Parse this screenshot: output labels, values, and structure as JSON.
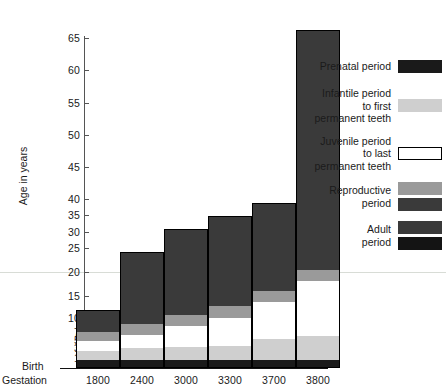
{
  "chart_data": {
    "type": "bar",
    "title": "",
    "xlabel": "Gestation",
    "ylabel": "Age in years",
    "grid": false,
    "legend_position": "right",
    "axis_note": "non-linear compressed y-axis at low values",
    "ylim": [
      0,
      67
    ],
    "ytick_labels": [
      "1",
      "3",
      "5",
      "7",
      "10",
      "15",
      "20",
      "25",
      "30",
      "35",
      "40",
      "45",
      "50",
      "55",
      "60",
      "65"
    ],
    "ytick_pixels": [
      358,
      348,
      340,
      332,
      318,
      296,
      272,
      248,
      232,
      215,
      199,
      167,
      135,
      103,
      70,
      38
    ],
    "categories": [
      "1800",
      "2400",
      "3000",
      "3300",
      "3700",
      "3800"
    ],
    "origin_labels": [
      "Birth",
      "Gestation"
    ],
    "series": [
      {
        "name": "Prenatal period",
        "values": [
          0.75,
          0.75,
          0.75,
          0.75,
          0.75,
          0.75
        ]
      },
      {
        "name": "Infantile period to first permanent teeth",
        "values": [
          2.3,
          3.0,
          3.2,
          3.5,
          5.5,
          6.0
        ]
      },
      {
        "name": "Juvenile period to last permanent teeth",
        "values": [
          3.5,
          6.0,
          9.0,
          11.0,
          14.0,
          19.0
        ]
      },
      {
        "name": "Reproductive period",
        "values": [
          5.5,
          7.5,
          10.0,
          12.0,
          16.0,
          21.0
        ]
      },
      {
        "name": "Adult period",
        "values": [
          13.5,
          24.5,
          30.0,
          32.5,
          35.0,
          67.0
        ]
      }
    ],
    "totals": [
      13.5,
      24.5,
      30.0,
      32.5,
      35.0,
      67.0
    ],
    "bar_pixel_tops": [
      310,
      252,
      229,
      216,
      203,
      30
    ],
    "segment_pixel_boundaries": [
      [
        368,
        361,
        351,
        341,
        332,
        310
      ],
      [
        368,
        361,
        349,
        335,
        324,
        252
      ],
      [
        368,
        361,
        348,
        326,
        315,
        229
      ],
      [
        368,
        361,
        347,
        318,
        306,
        216
      ],
      [
        368,
        361,
        340,
        302,
        291,
        203
      ],
      [
        368,
        361,
        337,
        281,
        270,
        30
      ]
    ]
  },
  "legend": {
    "items": [
      {
        "label_lines": [
          "Prenatal period"
        ],
        "colors": [
          "#1a1a1a"
        ]
      },
      {
        "label_lines": [
          "Infantile period",
          "to first",
          "permanent teeth"
        ],
        "colors": [
          "#cfcfcf"
        ]
      },
      {
        "label_lines": [
          "Juvenile period",
          "to last",
          "permanent teeth"
        ],
        "colors": [
          "#ffffff"
        ]
      },
      {
        "label_lines": [
          "Reproductive",
          "period"
        ],
        "colors": [
          "#9a9a9a",
          "#3a3a3a"
        ]
      },
      {
        "label_lines": [
          "Adult",
          "period"
        ],
        "colors": [
          "#3a3a3a",
          "#141414"
        ]
      }
    ]
  },
  "colors": {
    "prenatal": "#1a1a1a",
    "infantile": "#cfcfcf",
    "juvenile": "#ffffff",
    "reproductive_light": "#9a9a9a",
    "reproductive_dark": "#3a3a3a",
    "adult_dark": "#3a3a3a",
    "adult_black": "#141414",
    "axis": "#555555",
    "baseline": "#111111",
    "guide": "#d8dcd6"
  },
  "axis": {
    "y_title": "Age in years",
    "birth_label": "Birth",
    "gestation_label": "Gestation"
  }
}
